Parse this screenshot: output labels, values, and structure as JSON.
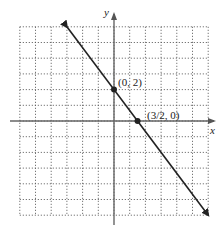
{
  "chart_data": {
    "type": "line",
    "title": "",
    "xlabel": "x",
    "ylabel": "y",
    "xlim": [
      -6,
      6
    ],
    "ylim": [
      -6,
      6
    ],
    "grid": true,
    "grid_style": "dotted",
    "grid_step": 1,
    "series": [
      {
        "name": "y = -4/3 x + 2",
        "x": [
          -3,
          0,
          1.5,
          6
        ],
        "y": [
          6,
          2,
          0,
          -6
        ],
        "arrows": "both"
      }
    ],
    "points": [
      {
        "x": 0,
        "y": 2,
        "label": "(0, 2)"
      },
      {
        "x": 1.5,
        "y": 0,
        "label": "(3/2, 0)"
      }
    ],
    "annotations": [
      "(0, 2)",
      "(3/2, 0)"
    ]
  },
  "labels": {
    "x_axis": "x",
    "y_axis": "y",
    "point_a": "(0, 2)",
    "point_b": "(3/2, 0)"
  }
}
